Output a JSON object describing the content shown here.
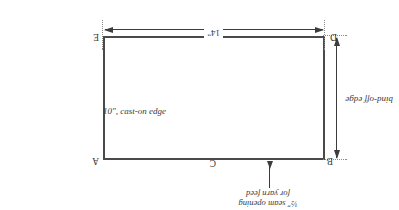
{
  "diagram": {
    "type": "knitting-panel-schematic",
    "orientation_note": "figure printed rotated 180 degrees",
    "shape": "rectangle",
    "dimensions": {
      "width_label": "14\"",
      "height_label": "10\", cast-on edge"
    },
    "corner_labels": {
      "a": "A",
      "b": "B",
      "c": "C",
      "d": "D",
      "e": "E"
    },
    "edge_labels": {
      "left": "10\", cast-on edge",
      "right": "bind-off edge",
      "top": "14\""
    },
    "annotations": {
      "seam_note_line1": "½\" seam opening",
      "seam_note_line2": "for yarn feed"
    },
    "colors": {
      "outline": "#4a4a4a",
      "dimension": "#3c3c3c",
      "extension": "#8a8a8a",
      "text": "#3a3a3a",
      "background": "#ffffff"
    }
  }
}
